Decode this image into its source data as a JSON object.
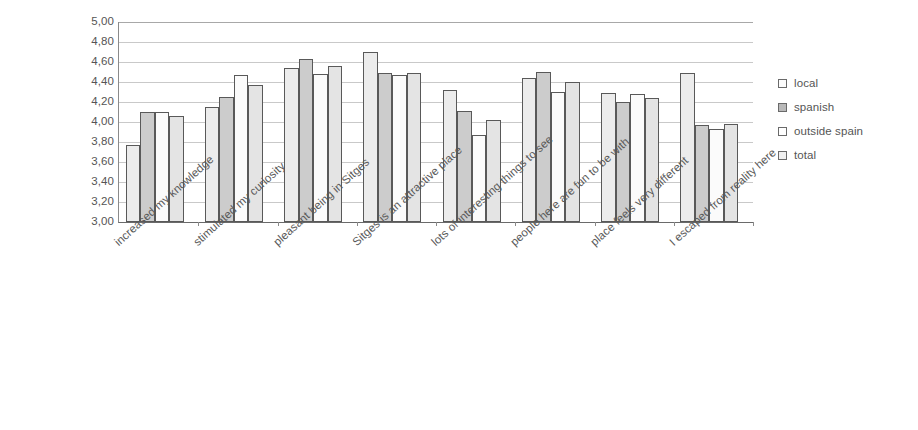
{
  "chart_data": {
    "type": "bar",
    "title": "",
    "subtitle": "",
    "xlabel": "",
    "ylabel": "",
    "ylim": [
      3.0,
      5.0
    ],
    "y_tick_step": 0.2,
    "grid": true,
    "legend_position": "right",
    "decimal_separator": ",",
    "y_tick_labels": [
      "5,00",
      "4,80",
      "4,60",
      "4,40",
      "4,20",
      "4,00",
      "3,80",
      "3,60",
      "3,40",
      "3,20",
      "3,00"
    ],
    "y_tick_values": [
      5.0,
      4.8,
      4.6,
      4.4,
      4.2,
      4.0,
      3.8,
      3.6,
      3.4,
      3.2,
      3.0
    ],
    "categories": [
      "increased my knowledge",
      "stimulated my curiosity",
      "pleasant being in Sitges",
      "Sitges is an attractive place",
      "lots of interesting things to see",
      "people here are fun to be with",
      "place feels very different",
      "I escaped from reality here"
    ],
    "series": [
      {
        "name": "local",
        "color": "#ececec",
        "values": [
          3.77,
          4.15,
          4.54,
          4.7,
          4.32,
          4.44,
          4.29,
          4.49
        ]
      },
      {
        "name": "spanish",
        "color": "#cccccc",
        "values": [
          4.1,
          4.25,
          4.63,
          4.49,
          4.11,
          4.5,
          4.2,
          3.97
        ]
      },
      {
        "name": "outside spain",
        "color": "#fbfbfb",
        "values": [
          4.1,
          4.47,
          4.48,
          4.47,
          3.87,
          4.3,
          4.28,
          3.93
        ]
      },
      {
        "name": "total",
        "color": "#e4e4e4",
        "values": [
          4.06,
          4.37,
          4.56,
          4.49,
          4.02,
          4.4,
          4.24,
          3.98
        ]
      }
    ]
  },
  "legend": {
    "items": [
      {
        "label": "local"
      },
      {
        "label": "spanish"
      },
      {
        "label": "outside spain"
      },
      {
        "label": "total"
      }
    ]
  }
}
